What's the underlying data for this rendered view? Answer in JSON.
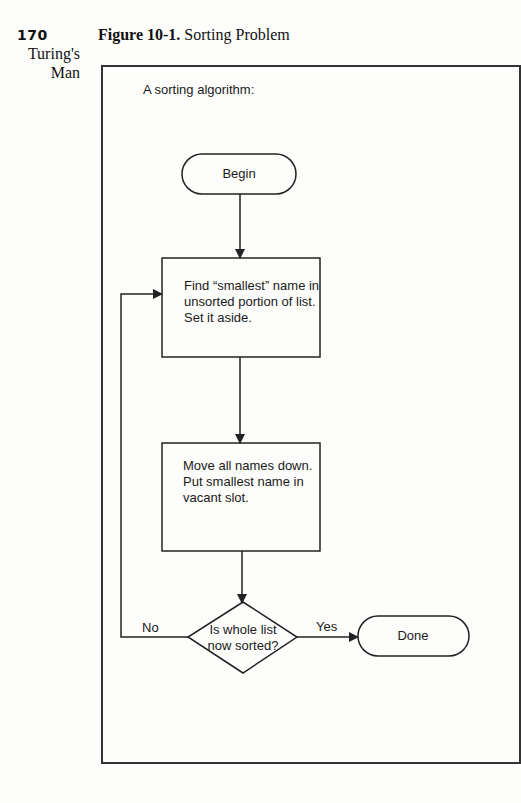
{
  "page": {
    "number": "170",
    "running_head_line1": "Turing's",
    "running_head_line2": "Man"
  },
  "figure": {
    "label": "Figure 10-1.",
    "title": "Sorting Problem",
    "intro": "A sorting algorithm:"
  },
  "flowchart": {
    "begin": "Begin",
    "step1": {
      "line1": "Find “smallest” name in",
      "line2": "unsorted portion of list.",
      "line3": "Set it aside."
    },
    "step2": {
      "line1": "Move all names down.",
      "line2": "Put smallest name in",
      "line3": "vacant slot."
    },
    "decision": {
      "line1": "Is whole list",
      "line2": "now sorted?"
    },
    "no_label": "No",
    "yes_label": "Yes",
    "done": "Done"
  }
}
